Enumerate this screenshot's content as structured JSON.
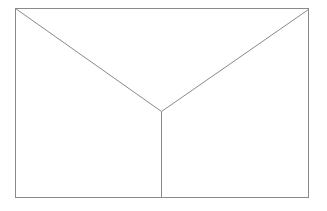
{
  "diagram": {
    "width": 327,
    "height": 211,
    "background": "#ffffff",
    "stroke_color": "#8a8a8a",
    "stroke_width": 1,
    "rectangle": {
      "x": 15,
      "y": 8,
      "width": 293,
      "height": 189
    },
    "vertex": {
      "x": 161,
      "y": 111
    },
    "lines": [
      {
        "name": "left-diagonal",
        "x1": 15,
        "y1": 8,
        "x2": 161,
        "y2": 111
      },
      {
        "name": "right-diagonal",
        "x1": 308,
        "y1": 9,
        "x2": 161,
        "y2": 111
      },
      {
        "name": "vertical-stem",
        "x1": 161,
        "y1": 111,
        "x2": 161,
        "y2": 197
      }
    ]
  }
}
